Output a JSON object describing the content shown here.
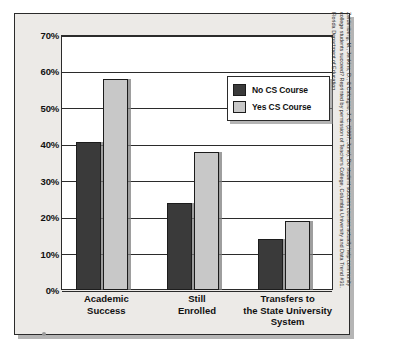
{
  "chart_data": {
    "type": "bar",
    "title": "",
    "xlabel": "",
    "ylabel": "",
    "ylim": [
      0,
      70
    ],
    "ytick_labels": [
      "70%",
      "60%",
      "50%",
      "40%",
      "30%",
      "20%",
      "10%",
      "0%"
    ],
    "ytick_values": [
      70,
      60,
      50,
      40,
      30,
      20,
      10,
      0
    ],
    "grid": true,
    "legend_position": "upper-right inside plot",
    "categories": [
      "Academic Success",
      "Still Enrolled",
      "Transfers to the State University System"
    ],
    "category_lines": [
      [
        "Academic",
        "Success"
      ],
      [
        "Still",
        "Enrolled"
      ],
      [
        "Transfers to",
        "the State University",
        "System"
      ]
    ],
    "series": [
      {
        "name": "No CS Course",
        "color": "#3a3a3a",
        "values": [
          40.5,
          24,
          14
        ]
      },
      {
        "name": "Yes CS Course",
        "color": "#c8c8c8",
        "values": [
          58,
          38,
          19
        ]
      }
    ]
  },
  "legend": {
    "items": [
      {
        "label": "No CS Course"
      },
      {
        "label": "Yes CS Course"
      }
    ]
  },
  "citation": {
    "line1": "Zeidenberg, M., Jenkins, D., & Calcagno, J. C. (2007, June). Do student success courses actually help community",
    "line2": "college students succeed? Reprinted by permission of Teachers College, Columbia University and Data Trend #31.",
    "line3": "Florida Department of Education"
  },
  "colors": {
    "series_dark": "#3a3a3a",
    "series_light": "#c8c8c8",
    "panel_background": "#eceae7",
    "plot_background": "#ffffff",
    "axis": "#2b2b2b"
  }
}
